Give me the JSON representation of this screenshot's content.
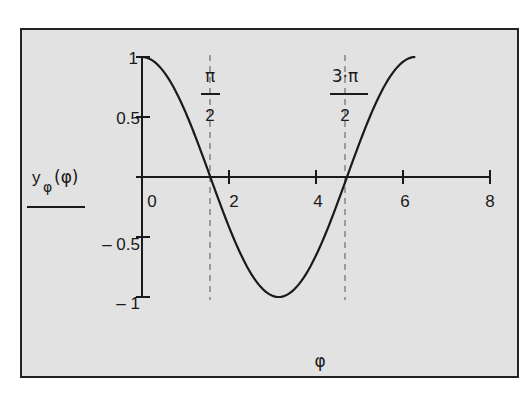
{
  "chart_data": {
    "type": "line",
    "title": "",
    "xlabel": "φ",
    "ylabel": "yφ(φ)",
    "ylabel_main": "y",
    "ylabel_sub": "φ",
    "ylabel_arg": "(φ)",
    "xlim": [
      0,
      8
    ],
    "ylim": [
      -1,
      1
    ],
    "grid": false,
    "legend": null,
    "x_ticks": [
      0,
      2,
      4,
      6,
      8
    ],
    "x_tick_labels": [
      "0",
      "2",
      "4",
      "6",
      "8"
    ],
    "y_ticks": [
      1,
      0.5,
      -0.5,
      -1
    ],
    "y_tick_labels": [
      "1",
      "0.5",
      "– 0.5",
      "– 1"
    ],
    "series": [
      {
        "name": "yφ(φ) = cos(φ)",
        "function": "cos(φ)",
        "domain": [
          0,
          6.2832
        ],
        "x": [
          0,
          0.5236,
          1.0472,
          1.5708,
          2.0944,
          2.618,
          3.1416,
          3.6652,
          4.1888,
          4.7124,
          5.236,
          5.7596,
          6.2832
        ],
        "y": [
          1,
          0.866,
          0.5,
          0,
          -0.5,
          -0.866,
          -1,
          -0.866,
          -0.5,
          0,
          0.5,
          0.866,
          1
        ]
      }
    ],
    "annotations": [
      {
        "type": "vline-dashed",
        "x": 1.5708,
        "label_num": "π",
        "label_den": "2"
      },
      {
        "type": "vline-dashed",
        "x": 4.7124,
        "label_num": "3·π",
        "label_den": "2"
      }
    ]
  },
  "labels": {
    "x_axis": "φ",
    "y_main": "y",
    "y_sub": "φ",
    "y_arg": "(φ)",
    "tick_x_0": "0",
    "tick_x_2": "2",
    "tick_x_4": "4",
    "tick_x_6": "6",
    "tick_x_8": "8",
    "tick_y_1": "1",
    "tick_y_05": "0.5",
    "tick_y_m05": "– 0.5",
    "tick_y_m1": "– 1",
    "ann1_num": "π",
    "ann1_den": "2",
    "ann2_num": "3·π",
    "ann2_den": "2"
  },
  "colors": {
    "background": "#e2e2e2",
    "line": "#1a1a1a",
    "frame": "#222222"
  }
}
